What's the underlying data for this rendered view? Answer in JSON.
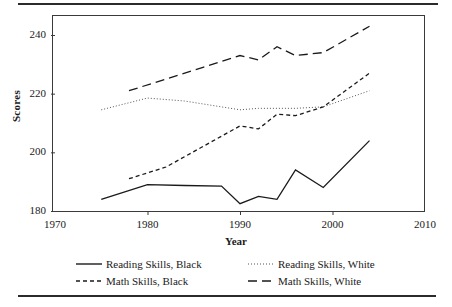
{
  "figure": {
    "rules": {
      "top": "top-rule",
      "bottom": "bottom-rule"
    }
  },
  "chart_data": {
    "type": "line",
    "title": "",
    "xlabel": "Year",
    "ylabel": "Scores",
    "xlim": [
      1970,
      2010
    ],
    "ylim": [
      176,
      246
    ],
    "xticks": [
      1970,
      1980,
      1990,
      2000,
      2010
    ],
    "yticks": [
      180,
      200,
      220,
      240
    ],
    "xtick_labels": [
      "1970",
      "1980",
      "1990",
      "2000",
      "2010"
    ],
    "ytick_labels": [
      "180",
      "200",
      "220",
      "240"
    ],
    "grid": false,
    "legend_position": "below",
    "series": [
      {
        "name": "Reading Skills, Black",
        "style": "solid",
        "color": "#1a1a1a",
        "x": [
          1975,
          1980,
          1984,
          1988,
          1990,
          1992,
          1994,
          1996,
          1999,
          2004
        ],
        "values": [
          184,
          189,
          188.7,
          188.5,
          182.5,
          185,
          184,
          194,
          188,
          204
        ]
      },
      {
        "name": "Reading Skills, White",
        "style": "dotted",
        "color": "#555555",
        "x": [
          1975,
          1980,
          1984,
          1988,
          1990,
          1992,
          1994,
          1996,
          1999,
          2004
        ],
        "values": [
          214.5,
          218.5,
          217.5,
          215.5,
          214.5,
          215,
          215,
          215,
          215.5,
          221
        ]
      },
      {
        "name": "Math Skills, Black",
        "style": "dashed-short",
        "color": "#1a1a1a",
        "x": [
          1978,
          1982,
          1986,
          1990,
          1992,
          1994,
          1996,
          1999,
          2004
        ],
        "values": [
          191,
          195,
          202,
          209,
          208,
          213,
          212.5,
          215.5,
          227
        ]
      },
      {
        "name": "Math Skills, White",
        "style": "dashed-long",
        "color": "#1a1a1a",
        "x": [
          1978,
          1982,
          1986,
          1990,
          1992,
          1994,
          1996,
          1999,
          2004
        ],
        "values": [
          221,
          225,
          229,
          233,
          231.5,
          236,
          233,
          234,
          243
        ]
      }
    ]
  },
  "legend": {
    "items": [
      {
        "label": "Reading Skills, Black",
        "style": "solid"
      },
      {
        "label": "Reading Skills, White",
        "style": "dotted"
      },
      {
        "label": "Math Skills, Black",
        "style": "dashed-short"
      },
      {
        "label": "Math Skills, White",
        "style": "dashed-long"
      }
    ]
  }
}
